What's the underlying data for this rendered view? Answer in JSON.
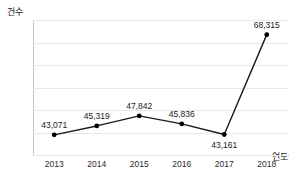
{
  "chart_data": {
    "type": "line",
    "title": "",
    "subtitle": "",
    "xlabel": "연도",
    "ylabel": "건수",
    "categories": [
      "2013",
      "2014",
      "2015",
      "2016",
      "2017",
      "2018"
    ],
    "values": [
      43071,
      45319,
      47842,
      45836,
      43161,
      68315
    ],
    "point_labels": [
      "43,071",
      "45,319",
      "47,842",
      "45,836",
      "43,161",
      "68,315"
    ],
    "label_positions": [
      "above",
      "above",
      "above",
      "above",
      "below",
      "above"
    ],
    "series": [
      {
        "name": "건수",
        "values": [
          43071,
          45319,
          47842,
          45836,
          43161,
          68315
        ]
      }
    ],
    "ylim": [
      38000,
      72000
    ],
    "grid": true,
    "gridlines": 7,
    "legend": "none",
    "line_color": "#1a1a1a",
    "marker_color": "#000000",
    "grid_color": "#e9e9e9",
    "axis_color": "#c4c4c4"
  },
  "axes": {
    "y_title": "건수",
    "x_title": "연도"
  }
}
